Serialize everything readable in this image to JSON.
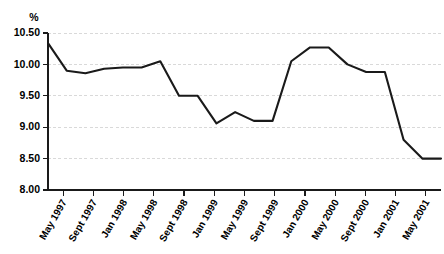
{
  "chart_data": {
    "type": "line",
    "title": "",
    "subtitle": "",
    "xlabel": "",
    "ylabel": "%",
    "unit_label": "%",
    "ylim": [
      8.0,
      10.5
    ],
    "ytick_labels": [
      "10.50",
      "10.00",
      "9.50",
      "9.00",
      "8.50",
      "8.00"
    ],
    "ytick_values": [
      10.5,
      10.0,
      9.5,
      9.0,
      8.5,
      8.0
    ],
    "grid": true,
    "grid_axis": "y",
    "legend": false,
    "legend_position": "none",
    "line_color": "#1a1a1a",
    "grid_color": "#c9c9c9",
    "axis_color": "#1a1a1a",
    "categories": [
      "May 1997",
      "Sept 1997",
      "Jan 1998",
      "May 1998",
      "Sept 1998",
      "Jan 1999",
      "May 1999",
      "Sept 1999",
      "Jan 2000",
      "May 2000",
      "Sept 2000",
      "Jan 2001",
      "May 2001"
    ],
    "values": [
      10.34,
      9.9,
      9.95,
      10.05,
      9.5,
      9.06,
      9.1,
      10.05,
      10.27,
      10.0,
      9.88,
      8.8,
      8.5
    ],
    "x": [
      0,
      1,
      2,
      3,
      4,
      5,
      6,
      7,
      8,
      9,
      10,
      11,
      12
    ],
    "series": [
      {
        "name": "percent",
        "values": [
          10.34,
          9.9,
          9.95,
          10.05,
          9.5,
          9.06,
          9.1,
          10.05,
          10.27,
          10.0,
          9.88,
          8.8,
          8.5
        ]
      }
    ],
    "detailed_points": [
      {
        "label": "May 1997",
        "value": 10.34
      },
      {
        "label": "Jul 1997",
        "value": 9.9
      },
      {
        "label": "Sept 1997",
        "value": 9.86
      },
      {
        "label": "Nov 1997",
        "value": 9.93
      },
      {
        "label": "Jan 1998",
        "value": 9.95
      },
      {
        "label": "Mar 1998",
        "value": 9.95
      },
      {
        "label": "May 1998",
        "value": 10.05
      },
      {
        "label": "Jul 1998",
        "value": 9.5
      },
      {
        "label": "Sept 1998",
        "value": 9.5
      },
      {
        "label": "Nov 1998",
        "value": 9.06
      },
      {
        "label": "Jan 1999",
        "value": 9.24
      },
      {
        "label": "Mar 1999",
        "value": 9.1
      },
      {
        "label": "May 1999",
        "value": 9.1
      },
      {
        "label": "Jul 1999",
        "value": 10.05
      },
      {
        "label": "Sept 1999",
        "value": 10.27
      },
      {
        "label": "Nov 1999",
        "value": 10.27
      },
      {
        "label": "Jan 2000",
        "value": 10.0
      },
      {
        "label": "Mar 2000",
        "value": 9.88
      },
      {
        "label": "May 2000",
        "value": 9.88
      },
      {
        "label": "Sept 2000",
        "value": 8.8
      },
      {
        "label": "Jan 2001",
        "value": 8.5
      },
      {
        "label": "May 2001",
        "value": 8.5
      }
    ],
    "annotations": []
  }
}
